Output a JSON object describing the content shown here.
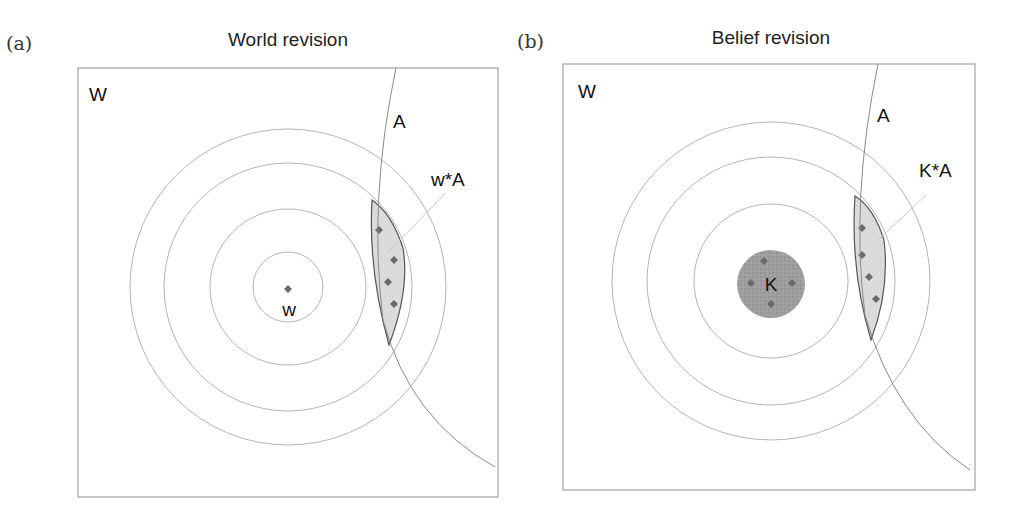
{
  "figure": {
    "colors": {
      "frame": "#9a9a9a",
      "rings": "#b5b5b5",
      "lens_fill": "#dcdcdc",
      "belief_disk_fill": "#9c9c9c",
      "points": "#6a6a6a"
    },
    "panels": [
      {
        "tag": "(a)",
        "title": "World revision",
        "universe_label": "W",
        "proposition_label": "A",
        "result_label": "w*A",
        "center_label": "w",
        "center_kind": "single-world",
        "ring_count": 4,
        "lens_point_count": 4
      },
      {
        "tag": "(b)",
        "title": "Belief revision",
        "universe_label": "W",
        "proposition_label": "A",
        "result_label": "K*A",
        "center_label": "K",
        "center_kind": "belief-set-disk",
        "ring_count": 3,
        "center_point_count": 4,
        "lens_point_count": 4
      }
    ]
  }
}
